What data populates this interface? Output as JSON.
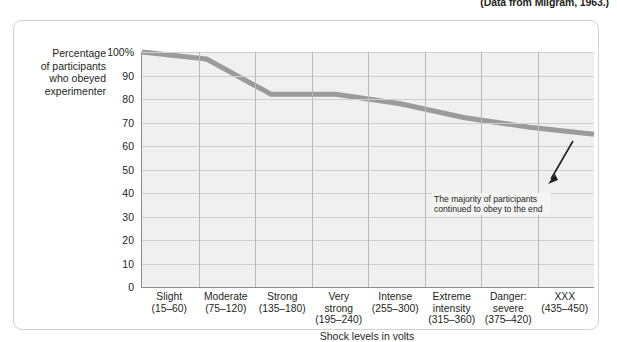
{
  "source_credit": "(Data from Milgram, 1963.)",
  "chart_data": {
    "type": "line",
    "title": "",
    "xlabel": "Shock levels in volts",
    "ylabel": "Percentage of participants who obeyed experimenter",
    "ylabel_lines": [
      "Percentage",
      "of participants",
      "who obeyed",
      "experimenter"
    ],
    "categories": [
      "Slight",
      "Moderate",
      "Strong",
      "Very strong",
      "Intense",
      "Extreme intensity",
      "Danger: severe",
      "XXX"
    ],
    "category_lines": [
      [
        "Slight"
      ],
      [
        "Moderate"
      ],
      [
        "Strong"
      ],
      [
        "Very",
        "strong"
      ],
      [
        "Intense"
      ],
      [
        "Extreme",
        "intensity"
      ],
      [
        "Danger:",
        "severe"
      ],
      [
        "XXX"
      ]
    ],
    "category_ranges": [
      "(15–60)",
      "(75–120)",
      "(135–180)",
      "(195–240)",
      "(255–300)",
      "(315–360)",
      "(375–420)",
      "(435–450)"
    ],
    "values": [
      100,
      97,
      82,
      82,
      78,
      72,
      68,
      65
    ],
    "ylim": [
      0,
      100
    ],
    "ytick_values": [
      0,
      10,
      20,
      30,
      40,
      50,
      60,
      70,
      80,
      90,
      100
    ],
    "ytick_labels": [
      "0",
      "10",
      "20",
      "30",
      "40",
      "50",
      "60",
      "70",
      "80",
      "90",
      "100%"
    ],
    "grid": true,
    "legend": "none",
    "line_color": "#9b9b9b",
    "plot_background": "#f0f0f0",
    "gridline_color": "#cfcfcf",
    "axis_color": "#8c8c8c"
  },
  "annotation": {
    "text": "The majority of participants continued to obey to the end"
  }
}
